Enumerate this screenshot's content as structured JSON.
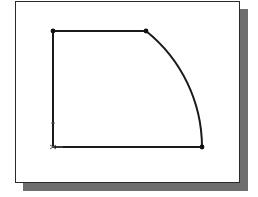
{
  "diagram": {
    "type": "cad-sketch",
    "colors": {
      "frame_border": "#2a2a2a",
      "shadow": "#6e6e6e",
      "stroke": "#1a1a1a",
      "background": "#ffffff"
    },
    "points": {
      "top_left": [
        53,
        31
      ],
      "arc_start": [
        146,
        31
      ],
      "bottom_right": [
        202,
        147
      ],
      "bottom_left": [
        53,
        147
      ]
    },
    "segments": [
      {
        "type": "line",
        "from": "top_left",
        "to": "arc_start"
      },
      {
        "type": "arc",
        "from": "arc_start",
        "to": "bottom_right",
        "center": "bottom_left",
        "radius": 149
      },
      {
        "type": "line",
        "from": "bottom_right",
        "to": "bottom_left"
      },
      {
        "type": "line",
        "from": "bottom_left",
        "to": "top_left"
      }
    ],
    "markers": [
      "origin-marker",
      "constraint-tick"
    ]
  }
}
